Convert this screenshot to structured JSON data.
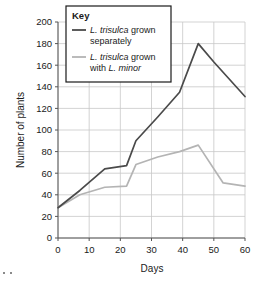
{
  "chart_data": {
    "type": "line",
    "title": "",
    "xlabel": "Days",
    "ylabel": "Number of plants",
    "xlim": [
      0,
      60
    ],
    "ylim": [
      0,
      200
    ],
    "xticks": [
      0,
      10,
      20,
      30,
      40,
      50,
      60
    ],
    "yticks": [
      0,
      20,
      40,
      60,
      80,
      100,
      120,
      140,
      160,
      180,
      200
    ],
    "grid": true,
    "legend_position": "top-left-inset",
    "legend_title": "Key",
    "series": [
      {
        "name": "L. trisulca grown separately",
        "name_parts": [
          "L. trisulca",
          " grown",
          "separately"
        ],
        "color": "#4a4a4a",
        "x": [
          0,
          7,
          15,
          22,
          25,
          32,
          39,
          45,
          50,
          60
        ],
        "values": [
          28,
          44,
          64,
          67,
          90,
          112,
          135,
          180,
          163,
          131
        ]
      },
      {
        "name": "L. trisulca grown with L. minor",
        "name_parts": [
          "L. trisulca",
          " grown",
          "with ",
          "L. minor"
        ],
        "color": "#b4b4b4",
        "x": [
          0,
          7,
          15,
          22,
          25,
          32,
          39,
          45,
          53,
          60
        ],
        "values": [
          28,
          40,
          47,
          48,
          68,
          75,
          80,
          86,
          51,
          48
        ]
      }
    ]
  },
  "axes": {
    "y_label": "Number of plants",
    "x_label": "Days",
    "y_tick_labels": [
      "0",
      "20",
      "40",
      "60",
      "80",
      "100",
      "120",
      "140",
      "160",
      "180",
      "200"
    ],
    "x_tick_labels": [
      "0",
      "10",
      "20",
      "30",
      "40",
      "50",
      "60"
    ]
  },
  "legend": {
    "title": "Key",
    "entries": [
      {
        "line1_italic": "L. trisulca",
        "line1_plain": " grown",
        "line2": "separately",
        "color": "#4a4a4a"
      },
      {
        "line1_italic": "L. trisulca",
        "line1_plain": " grown",
        "line2_plain": "with ",
        "line2_italic": "L. minor",
        "color": "#b4b4b4"
      }
    ]
  },
  "colors": {
    "grid": "#c8c8c8",
    "axis": "#555555",
    "series_dark": "#4a4a4a",
    "series_light": "#b4b4b4",
    "text": "#1a1a1a",
    "background": "#ffffff"
  }
}
